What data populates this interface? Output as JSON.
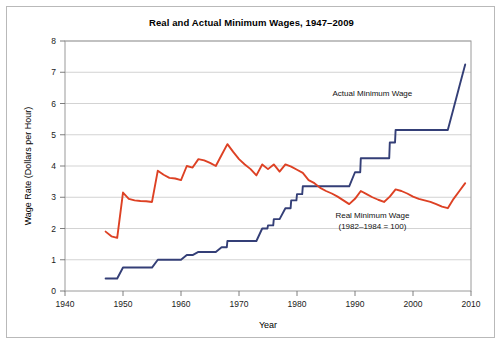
{
  "figure": {
    "title": "Real and Actual Minimum Wages, 1947–2009",
    "background": "#ffffff",
    "border_color": "#b9b9b9"
  },
  "annotations": {
    "actual_label": "Actual Minimum Wage",
    "real_label_line1": "Real Minimum Wage",
    "real_label_line2": "(1982–1984 = 100)"
  },
  "chart_data": {
    "type": "line",
    "title": "Real and Actual Minimum Wages, 1947–2009",
    "xlabel": "Year",
    "ylabel": "Wage Rate (Dollars per Hour)",
    "xlim": [
      1940,
      2010
    ],
    "ylim": [
      0,
      8
    ],
    "xticks": [
      1940,
      1950,
      1960,
      1970,
      1980,
      1990,
      2000,
      2010
    ],
    "yticks": [
      0,
      1,
      2,
      3,
      4,
      5,
      6,
      7,
      8
    ],
    "grid": "horizontal",
    "legend_position": "inline-annotations",
    "series": [
      {
        "name": "Actual Minimum Wage",
        "color": "#343f77",
        "label_x": 1993,
        "label_y": 6.25,
        "points": [
          [
            1947,
            0.4
          ],
          [
            1949,
            0.4
          ],
          [
            1950,
            0.75
          ],
          [
            1955,
            0.75
          ],
          [
            1956,
            1.0
          ],
          [
            1960,
            1.0
          ],
          [
            1961,
            1.15
          ],
          [
            1962,
            1.15
          ],
          [
            1963,
            1.25
          ],
          [
            1966,
            1.25
          ],
          [
            1967,
            1.4
          ],
          [
            1967.9,
            1.4
          ],
          [
            1968,
            1.6
          ],
          [
            1973,
            1.6
          ],
          [
            1974,
            2.0
          ],
          [
            1974.9,
            2.0
          ],
          [
            1975,
            2.1
          ],
          [
            1975.9,
            2.1
          ],
          [
            1976,
            2.3
          ],
          [
            1977,
            2.3
          ],
          [
            1978,
            2.65
          ],
          [
            1978.9,
            2.65
          ],
          [
            1979,
            2.9
          ],
          [
            1979.9,
            2.9
          ],
          [
            1980,
            3.1
          ],
          [
            1980.9,
            3.1
          ],
          [
            1981,
            3.35
          ],
          [
            1989,
            3.35
          ],
          [
            1990,
            3.8
          ],
          [
            1990.9,
            3.8
          ],
          [
            1991,
            4.25
          ],
          [
            1995.9,
            4.25
          ],
          [
            1996,
            4.75
          ],
          [
            1996.9,
            4.75
          ],
          [
            1997,
            5.15
          ],
          [
            2006,
            5.15
          ],
          [
            2007,
            5.85
          ],
          [
            2008,
            6.55
          ],
          [
            2009,
            7.25
          ]
        ]
      },
      {
        "name": "Real Minimum Wage (1982–1984 = 100)",
        "color": "#dd4124",
        "label_x": 1993,
        "label_y": 2.35,
        "points": [
          [
            1947,
            1.9
          ],
          [
            1948,
            1.75
          ],
          [
            1949,
            1.7
          ],
          [
            1950,
            3.15
          ],
          [
            1951,
            2.95
          ],
          [
            1952,
            2.9
          ],
          [
            1953,
            2.88
          ],
          [
            1954,
            2.87
          ],
          [
            1955,
            2.85
          ],
          [
            1956,
            3.85
          ],
          [
            1957,
            3.72
          ],
          [
            1958,
            3.62
          ],
          [
            1959,
            3.6
          ],
          [
            1960,
            3.55
          ],
          [
            1961,
            4.0
          ],
          [
            1962,
            3.95
          ],
          [
            1963,
            4.22
          ],
          [
            1964,
            4.18
          ],
          [
            1965,
            4.1
          ],
          [
            1966,
            4.0
          ],
          [
            1967,
            4.35
          ],
          [
            1968,
            4.7
          ],
          [
            1969,
            4.45
          ],
          [
            1970,
            4.22
          ],
          [
            1971,
            4.05
          ],
          [
            1972,
            3.9
          ],
          [
            1973,
            3.7
          ],
          [
            1974,
            4.05
          ],
          [
            1975,
            3.9
          ],
          [
            1976,
            4.05
          ],
          [
            1977,
            3.82
          ],
          [
            1978,
            4.05
          ],
          [
            1979,
            3.98
          ],
          [
            1980,
            3.88
          ],
          [
            1981,
            3.78
          ],
          [
            1982,
            3.55
          ],
          [
            1983,
            3.45
          ],
          [
            1984,
            3.3
          ],
          [
            1985,
            3.2
          ],
          [
            1986,
            3.12
          ],
          [
            1987,
            3.02
          ],
          [
            1988,
            2.9
          ],
          [
            1989,
            2.78
          ],
          [
            1990,
            2.95
          ],
          [
            1991,
            3.2
          ],
          [
            1992,
            3.1
          ],
          [
            1993,
            3.0
          ],
          [
            1994,
            2.92
          ],
          [
            1995,
            2.85
          ],
          [
            1996,
            3.02
          ],
          [
            1997,
            3.25
          ],
          [
            1998,
            3.2
          ],
          [
            1999,
            3.12
          ],
          [
            2000,
            3.02
          ],
          [
            2001,
            2.95
          ],
          [
            2002,
            2.9
          ],
          [
            2003,
            2.85
          ],
          [
            2004,
            2.78
          ],
          [
            2005,
            2.7
          ],
          [
            2006,
            2.65
          ],
          [
            2007,
            2.95
          ],
          [
            2008,
            3.2
          ],
          [
            2009,
            3.45
          ]
        ]
      }
    ]
  }
}
